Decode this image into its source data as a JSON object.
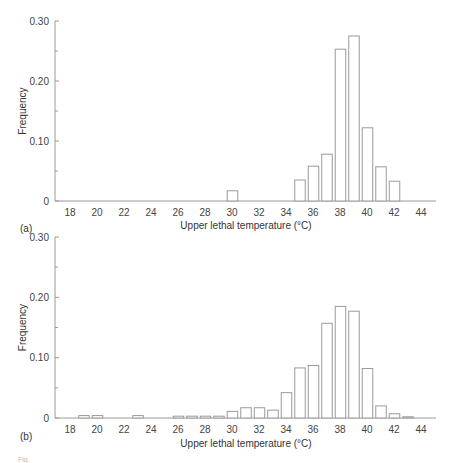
{
  "chart_data": [
    {
      "type": "bar",
      "panel_label": "(a)",
      "xlabel": "Upper lethal temperature (°C)",
      "ylabel": "Frequency",
      "ylim": [
        0,
        0.3
      ],
      "yticks": [
        "0",
        "0.10",
        "0.20",
        "0.30"
      ],
      "xticks": [
        "18",
        "20",
        "22",
        "24",
        "26",
        "28",
        "30",
        "32",
        "34",
        "36",
        "38",
        "40",
        "42",
        "44"
      ],
      "xlim": [
        17,
        45
      ],
      "grid": false,
      "bars": [
        {
          "x": 30,
          "value": 0.017
        },
        {
          "x": 35,
          "value": 0.035
        },
        {
          "x": 36,
          "value": 0.058
        },
        {
          "x": 37,
          "value": 0.078
        },
        {
          "x": 38,
          "value": 0.253
        },
        {
          "x": 39,
          "value": 0.275
        },
        {
          "x": 40,
          "value": 0.122
        },
        {
          "x": 41,
          "value": 0.057
        },
        {
          "x": 42,
          "value": 0.033
        }
      ]
    },
    {
      "type": "bar",
      "panel_label": "(b)",
      "xlabel": "Upper lethal temperature (°C)",
      "ylabel": "Frequency",
      "ylim": [
        0,
        0.3
      ],
      "yticks": [
        "0",
        "0.10",
        "0.20",
        "0.30"
      ],
      "xticks": [
        "18",
        "20",
        "22",
        "24",
        "26",
        "28",
        "30",
        "32",
        "34",
        "36",
        "38",
        "40",
        "42",
        "44"
      ],
      "xlim": [
        17,
        45
      ],
      "grid": false,
      "bars": [
        {
          "x": 19,
          "value": 0.004
        },
        {
          "x": 20,
          "value": 0.004
        },
        {
          "x": 23,
          "value": 0.004
        },
        {
          "x": 26,
          "value": 0.003
        },
        {
          "x": 27,
          "value": 0.003
        },
        {
          "x": 28,
          "value": 0.003
        },
        {
          "x": 29,
          "value": 0.003
        },
        {
          "x": 30,
          "value": 0.011
        },
        {
          "x": 31,
          "value": 0.017
        },
        {
          "x": 32,
          "value": 0.017
        },
        {
          "x": 33,
          "value": 0.013
        },
        {
          "x": 34,
          "value": 0.042
        },
        {
          "x": 35,
          "value": 0.083
        },
        {
          "x": 36,
          "value": 0.087
        },
        {
          "x": 37,
          "value": 0.157
        },
        {
          "x": 38,
          "value": 0.185
        },
        {
          "x": 39,
          "value": 0.177
        },
        {
          "x": 40,
          "value": 0.082
        },
        {
          "x": 41,
          "value": 0.02
        },
        {
          "x": 42,
          "value": 0.007
        },
        {
          "x": 43,
          "value": 0.002
        }
      ]
    }
  ],
  "caption_fragment": "Fig."
}
